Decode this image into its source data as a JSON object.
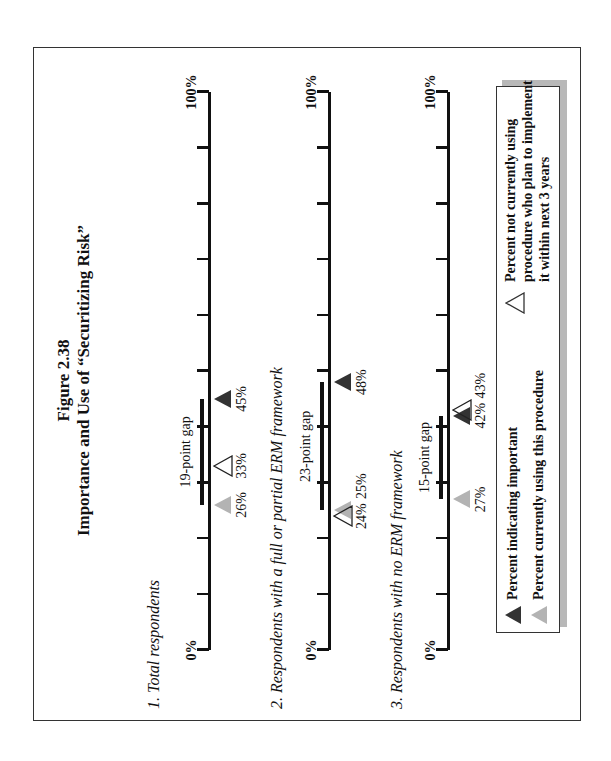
{
  "figure": {
    "number": "Figure 2.38",
    "title": "Importance and Use of “Securitizing Risk”"
  },
  "axis": {
    "min_label": "0%",
    "max_label": "100%",
    "ticks": 10
  },
  "rows": [
    {
      "label": "1.  Total respondents",
      "gap_label": "19-point gap",
      "important": 45,
      "currently_using": 26,
      "plan_to_implement": 33,
      "labels": {
        "important": "45%",
        "currently_using": "26%",
        "plan_to_implement": "33%"
      }
    },
    {
      "label": "2.  Respondents with a full or partial ERM framework",
      "gap_label": "23-point gap",
      "important": 48,
      "currently_using": 25,
      "plan_to_implement": 24,
      "labels": {
        "important": "48%",
        "currently_using": "25%",
        "plan_to_implement": "24%"
      }
    },
    {
      "label": "3.  Respondents with no ERM framework",
      "gap_label": "15-point gap",
      "important": 42,
      "currently_using": 27,
      "plan_to_implement": 43,
      "labels": {
        "important": "42%",
        "currently_using": "27%",
        "plan_to_implement": "43%"
      }
    }
  ],
  "legend": {
    "important": "Percent indicating important",
    "currently_using": "Percent currently using this procedure",
    "plan_lines": [
      "Percent not currently using",
      "procedure who plan to implement",
      "it within next 3 years"
    ]
  },
  "colors": {
    "important": "#333333",
    "currently_using": "#b3b3b3",
    "plan_to_implement": "#ffffff",
    "shadow": "#b8b8b8"
  },
  "chart_data": {
    "type": "scatter",
    "title": "Figure 2.38 Importance and Use of “Securitizing Risk”",
    "orientation": "rotated 90° counter-clockwise (page landscape)",
    "categories": [
      "Total respondents",
      "Respondents with a full or partial ERM framework",
      "Respondents with no ERM framework"
    ],
    "series": [
      {
        "name": "Percent indicating important",
        "marker": "dark triangle",
        "values": [
          45,
          48,
          42
        ]
      },
      {
        "name": "Percent currently using this procedure",
        "marker": "light gray triangle",
        "values": [
          26,
          25,
          27
        ]
      },
      {
        "name": "Percent not currently using procedure who plan to implement it within next 3 years",
        "marker": "open triangle",
        "values": [
          33,
          24,
          43
        ]
      }
    ],
    "annotations": [
      "19-point gap",
      "23-point gap",
      "15-point gap"
    ],
    "xlabel": "",
    "ylabel": "",
    "xlim": [
      0,
      100
    ],
    "tick_labels": [
      "0%",
      "100%"
    ],
    "grid": false,
    "legend_position": "bottom"
  }
}
